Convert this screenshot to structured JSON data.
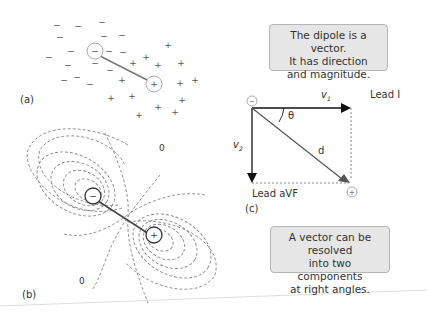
{
  "panels": {
    "a": {
      "label": "(a)"
    },
    "b": {
      "label": "(b)",
      "zero_labels": [
        "0",
        "0"
      ]
    },
    "c": {
      "label": "(c)",
      "lead_horizontal": "Lead I",
      "lead_vertical": "Lead aVF",
      "v1": "v",
      "v1_sub": "1",
      "v2": "v",
      "v2_sub": "2",
      "angle": "θ",
      "resultant": "d"
    }
  },
  "charges": {
    "negative": "−",
    "positive": "+"
  },
  "notes": {
    "top": [
      "The dipole is a vector.",
      "It has direction",
      "and magnitude."
    ],
    "bottom": [
      "A vector can be resolved",
      "into two components",
      "at right angles."
    ]
  },
  "colors": {
    "note_bg": "#e6e6e6",
    "note_border": "#b5b5b5",
    "line": "#555555",
    "dash": "#888888",
    "arrow": "#111111"
  }
}
